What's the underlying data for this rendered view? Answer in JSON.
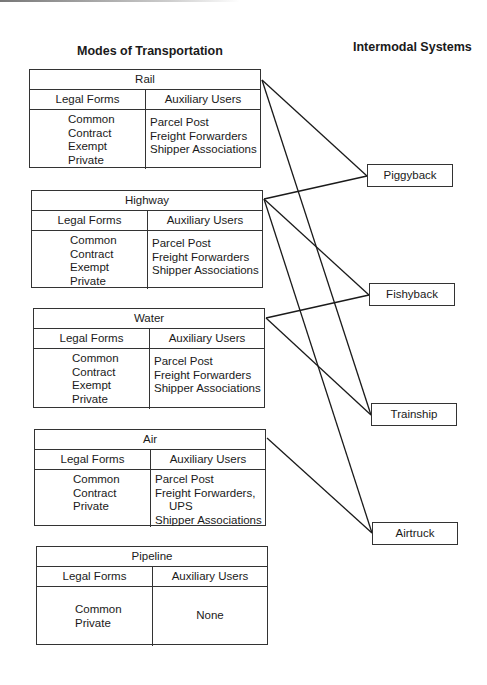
{
  "headings": {
    "modes": "Modes of Transportation",
    "intermodal": "Intermodal Systems"
  },
  "column_headers": {
    "legal": "Legal Forms",
    "aux": "Auxiliary Users"
  },
  "modes": [
    {
      "name": "Rail",
      "legal_forms": [
        "Common",
        "Contract",
        "Exempt",
        "Private"
      ],
      "auxiliary_users": [
        "Parcel Post",
        "Freight Forwarders",
        "Shipper Associations"
      ]
    },
    {
      "name": "Highway",
      "legal_forms": [
        "Common",
        "Contract",
        "Exempt",
        "Private"
      ],
      "auxiliary_users": [
        "Parcel Post",
        "Freight Forwarders",
        "Shipper Associations"
      ]
    },
    {
      "name": "Water",
      "legal_forms": [
        "Common",
        "Contract",
        "Exempt",
        "Private"
      ],
      "auxiliary_users": [
        "Parcel Post",
        "Freight Forwarders",
        "Shipper Associations"
      ]
    },
    {
      "name": "Air",
      "legal_forms": [
        "Common",
        "Contract",
        "Private"
      ],
      "auxiliary_users": [
        "Parcel Post",
        "Freight Forwarders,",
        "UPS",
        "Shipper Associations"
      ]
    },
    {
      "name": "Pipeline",
      "legal_forms": [
        "Common",
        "Private"
      ],
      "auxiliary_users": [
        "None"
      ]
    }
  ],
  "intermodal_systems": [
    "Piggyback",
    "Fishyback",
    "Trainship",
    "Airtruck"
  ],
  "connections": [
    {
      "from": "Rail",
      "to": "Piggyback"
    },
    {
      "from": "Rail",
      "to": "Trainship"
    },
    {
      "from": "Highway",
      "to": "Piggyback"
    },
    {
      "from": "Highway",
      "to": "Fishyback"
    },
    {
      "from": "Highway",
      "to": "Airtruck"
    },
    {
      "from": "Water",
      "to": "Fishyback"
    },
    {
      "from": "Water",
      "to": "Trainship"
    },
    {
      "from": "Air",
      "to": "Airtruck"
    }
  ],
  "colors": {
    "line": "#1a1a1a",
    "border": "#333333",
    "background": "#ffffff"
  }
}
